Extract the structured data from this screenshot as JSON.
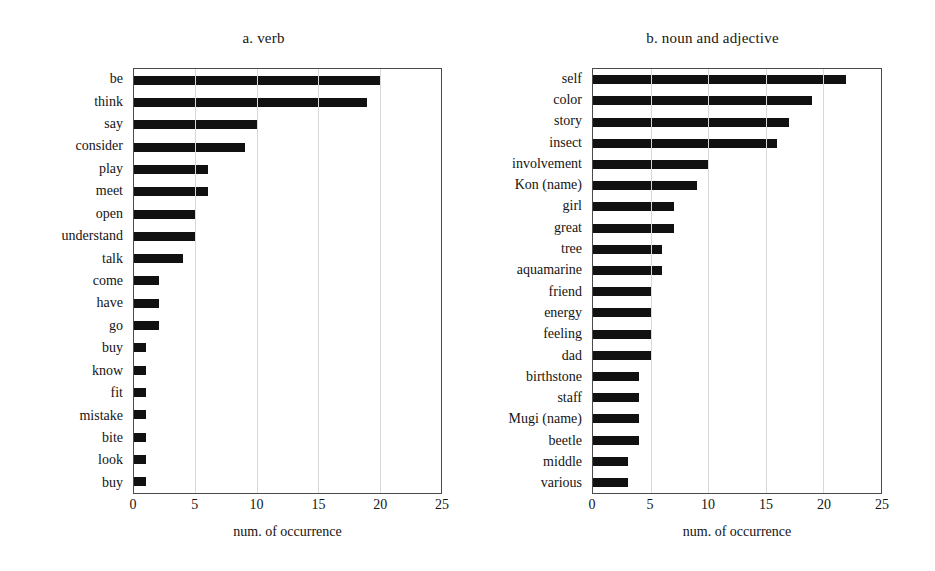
{
  "chart_data": [
    {
      "type": "bar",
      "orientation": "horizontal",
      "title": "a. verb",
      "xlabel": "num. of occurrence",
      "ylabel": "",
      "xlim": [
        0,
        25
      ],
      "xticks": [
        0,
        5,
        10,
        15,
        20,
        25
      ],
      "grid": true,
      "legend": "none",
      "bar_color": "#111111",
      "categories": [
        "be",
        "think",
        "say",
        "consider",
        "play",
        "meet",
        "open",
        "understand",
        "talk",
        "come",
        "have",
        "go",
        "buy",
        "know",
        "fit",
        "mistake",
        "bite",
        "look",
        "buy"
      ],
      "values": [
        20,
        19,
        10,
        9,
        6,
        6,
        5,
        5,
        4,
        2,
        2,
        2,
        1,
        1,
        1,
        1,
        1,
        1,
        1
      ]
    },
    {
      "type": "bar",
      "orientation": "horizontal",
      "title": "b. noun and adjective",
      "xlabel": "num. of occurrence",
      "ylabel": "",
      "xlim": [
        0,
        25
      ],
      "xticks": [
        0,
        5,
        10,
        15,
        20,
        25
      ],
      "grid": true,
      "legend": "none",
      "bar_color": "#111111",
      "categories": [
        "self",
        "color",
        "story",
        "insect",
        "involvement",
        "Kon (name)",
        "girl",
        "great",
        "tree",
        "aquamarine",
        "friend",
        "energy",
        "feeling",
        "dad",
        "birthstone",
        "staff",
        "Mugi (name)",
        "beetle",
        "middle",
        "various"
      ],
      "values": [
        22,
        19,
        17,
        16,
        10,
        9,
        7,
        7,
        6,
        6,
        5,
        5,
        5,
        5,
        4,
        4,
        4,
        4,
        3,
        3
      ]
    }
  ]
}
